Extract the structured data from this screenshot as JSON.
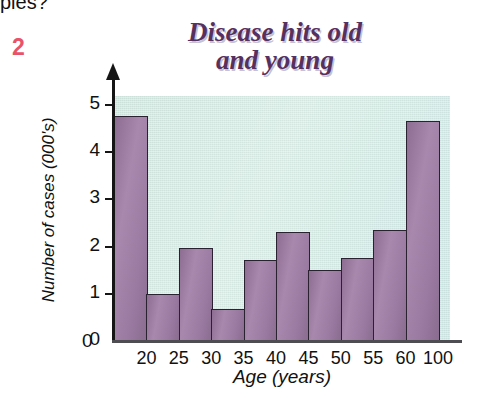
{
  "page": {
    "scrap_text": "ples?",
    "figure_number": "2"
  },
  "chart_data": {
    "type": "bar",
    "title": "Disease hits old\nand young",
    "xlabel": "Age (years)",
    "ylabel": "Number of cases (000's)",
    "categories": [
      "20",
      "25",
      "30",
      "35",
      "40",
      "45",
      "50",
      "55",
      "60",
      "100"
    ],
    "values": [
      4.77,
      1.0,
      1.98,
      0.68,
      1.72,
      2.3,
      1.51,
      1.76,
      2.35,
      4.66
    ],
    "ylim": [
      0,
      5
    ],
    "y_ticks": [
      "0",
      "1",
      "2",
      "3",
      "4",
      "5"
    ],
    "x_ticks": [
      "20",
      "25",
      "30",
      "35",
      "40",
      "45",
      "50",
      "55",
      "60",
      "100"
    ],
    "x_zero_label": "0",
    "grid": false,
    "legend": "none",
    "colors": {
      "bar_fill": "#9d7c9d",
      "bar_edge": "#2a2230",
      "plot_background": "#d9ebe3",
      "title_color": "#56305f",
      "axis_color": "#151515",
      "figure_number_color": "#e8536a"
    }
  }
}
